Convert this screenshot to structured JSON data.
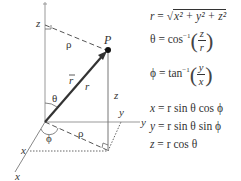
{
  "diagram": {
    "labels": {
      "z_axis_tick": "z",
      "rho_top": "ρ",
      "point": "P",
      "vector": "r",
      "magnitude": "r",
      "theta": "θ",
      "z_height": "z",
      "y_tick": "y",
      "y_axis": "y",
      "rho_bottom": "ρ",
      "phi": "ϕ",
      "x_tick": "x",
      "x_axis": "x"
    },
    "colors": {
      "axis": "#888888",
      "vector": "#333333",
      "point": "#111111"
    }
  },
  "equations": [
    {
      "id": "r",
      "lhs": "r",
      "eq": " = ",
      "text": "x² + y² + z²"
    },
    {
      "id": "theta",
      "lhs": "θ",
      "eq": " = cos",
      "sup": "−1",
      "num": "z",
      "den": "r"
    },
    {
      "id": "phi",
      "lhs": "ϕ",
      "eq": " = tan",
      "sup": "−1",
      "num": "y",
      "den": "x"
    },
    {
      "id": "x",
      "lhs": "x",
      "eq": " = ",
      "rhs": "r sin θ cos ϕ"
    },
    {
      "id": "y",
      "lhs": "y",
      "eq": " = ",
      "rhs": "r sin θ sin ϕ"
    },
    {
      "id": "z",
      "lhs": "z",
      "eq": " = ",
      "rhs": "r cos θ"
    }
  ]
}
